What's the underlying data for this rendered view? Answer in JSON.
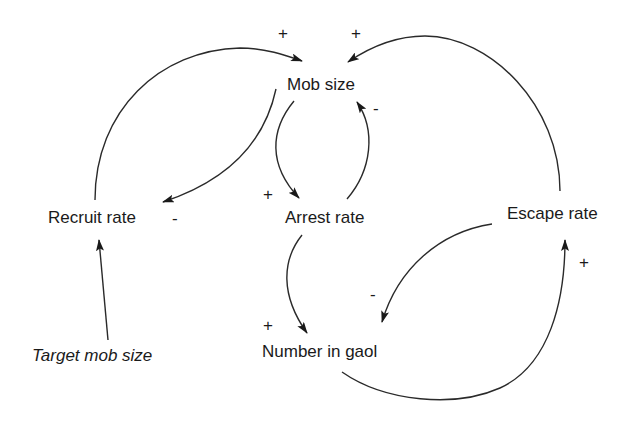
{
  "diagram": {
    "type": "causal-loop-diagram",
    "nodes": [
      {
        "id": "mob_size",
        "label": "Mob size",
        "italic": false
      },
      {
        "id": "recruit_rate",
        "label": "Recruit rate",
        "italic": false
      },
      {
        "id": "arrest_rate",
        "label": "Arrest rate",
        "italic": false
      },
      {
        "id": "escape_rate",
        "label": "Escape rate",
        "italic": false
      },
      {
        "id": "number_in_gaol",
        "label": "Number in gaol",
        "italic": false
      },
      {
        "id": "target_mob_size",
        "label": "Target mob size",
        "italic": true
      }
    ],
    "links": [
      {
        "from": "recruit_rate",
        "to": "mob_size",
        "polarity": "+"
      },
      {
        "from": "mob_size",
        "to": "recruit_rate",
        "polarity": "-"
      },
      {
        "from": "mob_size",
        "to": "arrest_rate",
        "polarity": "+"
      },
      {
        "from": "arrest_rate",
        "to": "mob_size",
        "polarity": "-"
      },
      {
        "from": "escape_rate",
        "to": "mob_size",
        "polarity": "+"
      },
      {
        "from": "arrest_rate",
        "to": "number_in_gaol",
        "polarity": "+"
      },
      {
        "from": "escape_rate",
        "to": "number_in_gaol",
        "polarity": "-"
      },
      {
        "from": "number_in_gaol",
        "to": "escape_rate",
        "polarity": "+"
      },
      {
        "from": "target_mob_size",
        "to": "recruit_rate",
        "polarity": null
      }
    ],
    "signs": {
      "recruit_to_mob": "+",
      "escape_to_mob": "+",
      "arrest_to_mob": "-",
      "mob_to_arrest": "+",
      "mob_to_recruit": "-",
      "number_to_escape": "+",
      "escape_to_number": "-",
      "arrest_to_number": "+"
    }
  }
}
